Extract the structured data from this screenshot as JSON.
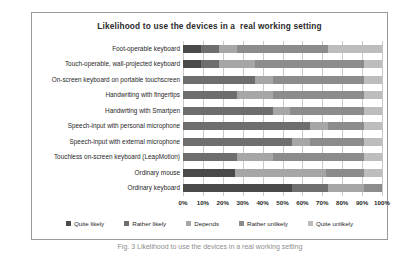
{
  "chart_data": {
    "type": "bar",
    "orientation": "horizontal",
    "stacked": true,
    "stack_mode": "percent",
    "title": "Likelihood to use the devices in a  real working setting",
    "xlabel": "",
    "ylabel": "",
    "xlim": [
      0,
      100
    ],
    "xtick_labels": [
      "0%",
      "10%",
      "20%",
      "30%",
      "40%",
      "50%",
      "60%",
      "70%",
      "80%",
      "90%",
      "100%"
    ],
    "xtick_values": [
      0,
      10,
      20,
      30,
      40,
      50,
      60,
      70,
      80,
      90,
      100
    ],
    "grid": true,
    "grid_axis": "x",
    "legend_position": "bottom",
    "categories": [
      "Foot-operable keyboard",
      "Touch-operable, wall-projected keyboard",
      "On-screen keyboard on portable touchscreen",
      "Handwriting with fingertips",
      "Handwrting with Smartpen",
      "Speech-input with personal microphone",
      "Speech-input with external microphone",
      "Touchless on-screen keyboard (LeapMotion)",
      "Ordinary mouse",
      "Ordinary keyboard"
    ],
    "series": [
      {
        "name": "Quite likely",
        "color": "#4a4a4a",
        "values": [
          9,
          9,
          0,
          0,
          0,
          0,
          0,
          0,
          26,
          55
        ]
      },
      {
        "name": "Rather likely",
        "color": "#6e6e6e",
        "values": [
          9,
          9,
          36,
          27,
          45,
          64,
          55,
          27,
          0,
          18
        ]
      },
      {
        "name": "Depends",
        "color": "#a6a6a6",
        "values": [
          9,
          18,
          9,
          18,
          9,
          9,
          9,
          18,
          46,
          18
        ]
      },
      {
        "name": "Rather unlikely",
        "color": "#8c8c8c",
        "values": [
          46,
          55,
          46,
          46,
          37,
          18,
          27,
          46,
          19,
          9
        ]
      },
      {
        "name": "Quite unlikely",
        "color": "#bdbdbd",
        "values": [
          27,
          9,
          9,
          9,
          9,
          9,
          9,
          9,
          9,
          0
        ]
      }
    ]
  },
  "caption": "Fig. 3  Likelihood to use the devices in a real working setting"
}
